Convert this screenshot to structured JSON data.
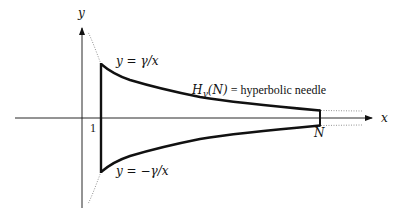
{
  "diagram": {
    "title": "Hyperbolic needle",
    "axes": {
      "x_label": "x",
      "y_label": "y"
    },
    "ticks": {
      "left_bound": "1",
      "right_bound": "N"
    },
    "curves": {
      "upper_label": "y = γ/x",
      "lower_label": "y = −γ/x"
    },
    "region_label": {
      "symbol": "H",
      "subscript": "γ",
      "argument": "(N)",
      "equals_text": " = hyperbolic needle"
    },
    "colors": {
      "stroke": "#111111",
      "dotted": "#777777",
      "background": "#ffffff"
    }
  }
}
